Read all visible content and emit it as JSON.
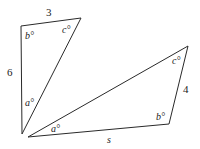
{
  "triangle1": {
    "side_top": "3",
    "side_left": "6",
    "angle_top_left": "b°",
    "angle_top_right": "c°",
    "angle_bottom": "a°"
  },
  "triangle2": {
    "side_right": "4",
    "side_bottom": "s",
    "angle_left": "a°",
    "angle_top_right": "c°",
    "angle_bottom_right": "b°"
  }
}
